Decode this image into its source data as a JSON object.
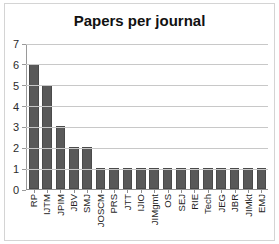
{
  "chart_data": {
    "type": "bar",
    "title": "Papers per journal",
    "xlabel": "",
    "ylabel": "",
    "ylim": [
      0,
      7
    ],
    "yticks": [
      0,
      1,
      2,
      3,
      4,
      5,
      6,
      7
    ],
    "grid": true,
    "legend": false,
    "orientation": "vertical",
    "bar_color": "#595959",
    "bar_border_color": "#4a4a4a",
    "gridline_color": "#c8c8c8",
    "axis_color": "#8f8f8f",
    "categories": [
      "RP",
      "IJTM",
      "JPIM",
      "JBV",
      "SMJ",
      "JOSCM",
      "PRS",
      "JTT",
      "IJIO",
      "JIMgmt",
      "OS",
      "SEJ",
      "RIE",
      "Tech",
      "JEG",
      "JBR",
      "JIMkt",
      "EMJ"
    ],
    "values": [
      6,
      5,
      3,
      2,
      2,
      1,
      1,
      1,
      1,
      1,
      1,
      1,
      1,
      1,
      1,
      1,
      1,
      1
    ]
  }
}
